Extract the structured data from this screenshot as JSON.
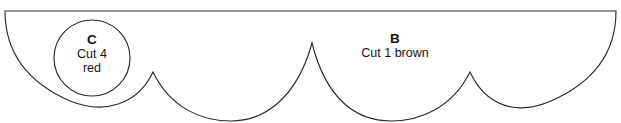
{
  "document": {
    "kind": "sewing-pattern-template",
    "background_color": "#ffffff",
    "outline_color": "#2b2b2b",
    "text_color": "#141414"
  },
  "pieces": [
    {
      "id": "piece-c",
      "letter": "C",
      "cut_line": "Cut 4",
      "fabric_line": "red",
      "shape": "circle",
      "center_x": 92,
      "center_y": 58,
      "radius": 38
    },
    {
      "id": "piece-b",
      "letter": "B",
      "cut_line": "Cut 1 brown",
      "fabric_line": "",
      "shape": "scalloped-half-round",
      "label_x": 395,
      "label_y": 40
    }
  ],
  "outline": {
    "top_edge_y": 11,
    "top_left_x": 5,
    "top_right_x": 616,
    "scallop_peaks": [
      {
        "x": 153,
        "y": 72
      },
      {
        "x": 312,
        "y": 43
      },
      {
        "x": 470,
        "y": 72
      }
    ],
    "valley_bottom_y": 115,
    "path": "M 5 11 L 616 11 C 616 54 592 83 551 101 C 516 116 486 106 470 72 C 452 108 420 121 391 121 C 356 121 326 99 312 43 C 296 101 262 121 231 121 C 200 121 170 107 153 72 C 138 104 105 115 70 101 C 29 83 5 54 5 11 Z",
    "circle_path": "M 92 20 A 38 38 0 1 1 92 96 A 38 38 0 1 1 92 20 Z"
  }
}
